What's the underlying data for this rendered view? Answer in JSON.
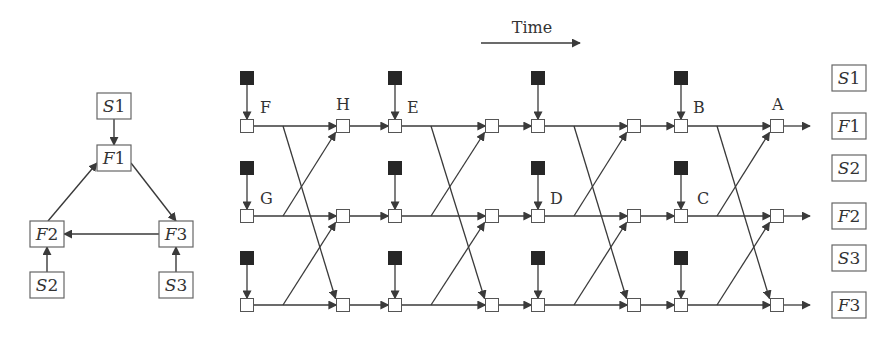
{
  "colors": {
    "stroke": "#3a3a3a",
    "source_fill": "#262626",
    "node_fill": "#ffffff",
    "background": "#ffffff"
  },
  "left_graph": {
    "nodes": [
      {
        "id": "S1",
        "letter": "S",
        "num": "1",
        "x": 97,
        "y": 93,
        "w": 34,
        "h": 26
      },
      {
        "id": "F1",
        "letter": "F",
        "num": "1",
        "x": 97,
        "y": 145,
        "w": 34,
        "h": 26
      },
      {
        "id": "F2",
        "letter": "F",
        "num": "2",
        "x": 30,
        "y": 221,
        "w": 34,
        "h": 26
      },
      {
        "id": "F3",
        "letter": "F",
        "num": "3",
        "x": 159,
        "y": 221,
        "w": 34,
        "h": 26
      },
      {
        "id": "S2",
        "letter": "S",
        "num": "2",
        "x": 30,
        "y": 272,
        "w": 34,
        "h": 26
      },
      {
        "id": "S3",
        "letter": "S",
        "num": "3",
        "x": 159,
        "y": 272,
        "w": 34,
        "h": 26
      }
    ],
    "edges": [
      {
        "from": "S1",
        "to": "F1",
        "x1": 114,
        "y1": 119,
        "x2": 114,
        "y2": 145
      },
      {
        "from": "F1",
        "to": "F3",
        "x1": 131,
        "y1": 163,
        "x2": 176,
        "y2": 221
      },
      {
        "from": "F2",
        "to": "F1",
        "x1": 48,
        "y1": 221,
        "x2": 97,
        "y2": 163
      },
      {
        "from": "F3",
        "to": "F2",
        "x1": 159,
        "y1": 234,
        "x2": 64,
        "y2": 234
      },
      {
        "from": "S2",
        "to": "F2",
        "x1": 47,
        "y1": 272,
        "x2": 47,
        "y2": 247
      },
      {
        "from": "S3",
        "to": "F3",
        "x1": 176,
        "y1": 272,
        "x2": 176,
        "y2": 247
      }
    ]
  },
  "timeline": {
    "time_label": "Time",
    "time_arrow": {
      "x1": 481,
      "y1": 43,
      "x2": 580,
      "y2": 43,
      "label_x": 532,
      "label_y": 33
    },
    "row_labels": [
      {
        "id": "S1",
        "letter": "S",
        "num": "1",
        "y": 78
      },
      {
        "id": "F1",
        "letter": "F",
        "num": "1",
        "y": 126
      },
      {
        "id": "S2",
        "letter": "S",
        "num": "2",
        "y": 168
      },
      {
        "id": "F2",
        "letter": "F",
        "num": "2",
        "y": 216
      },
      {
        "id": "S3",
        "letter": "S",
        "num": "3",
        "y": 258
      },
      {
        "id": "F3",
        "letter": "F",
        "num": "3",
        "y": 305
      }
    ],
    "row_label_x": 832,
    "row_label_w": 34,
    "row_label_h": 26,
    "rows_y": [
      126,
      216,
      305
    ],
    "source_rows_y": [
      78,
      168,
      258
    ],
    "columns_x": [
      247,
      343,
      395,
      492,
      538,
      634,
      681,
      777
    ],
    "source_columns": [
      0,
      2,
      4,
      6
    ],
    "end_arrow_x": 810,
    "node_size": 13,
    "source_size": 13,
    "letter_labels": [
      {
        "text": "F",
        "x": 260,
        "y": 113
      },
      {
        "text": "H",
        "x": 336,
        "y": 110
      },
      {
        "text": "E",
        "x": 407,
        "y": 113
      },
      {
        "text": "G",
        "x": 260,
        "y": 204
      },
      {
        "text": "D",
        "x": 550,
        "y": 204
      },
      {
        "text": "B",
        "x": 693,
        "y": 113
      },
      {
        "text": "C",
        "x": 697,
        "y": 204
      },
      {
        "text": "A",
        "x": 772,
        "y": 110
      }
    ]
  }
}
